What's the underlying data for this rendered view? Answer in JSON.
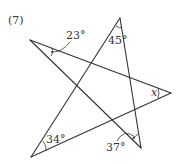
{
  "problem_label": "(7)",
  "angles": {
    "top_left": "23°",
    "top": "45°",
    "right": "x",
    "bottom_right": "37°",
    "bottom_left": "34°"
  },
  "vertices": {
    "A": [
      30,
      40
    ],
    "B": [
      120,
      18
    ],
    "C": [
      171,
      93
    ],
    "D": [
      141,
      148
    ],
    "E": [
      31,
      157
    ]
  },
  "stroke_color": "#333333"
}
